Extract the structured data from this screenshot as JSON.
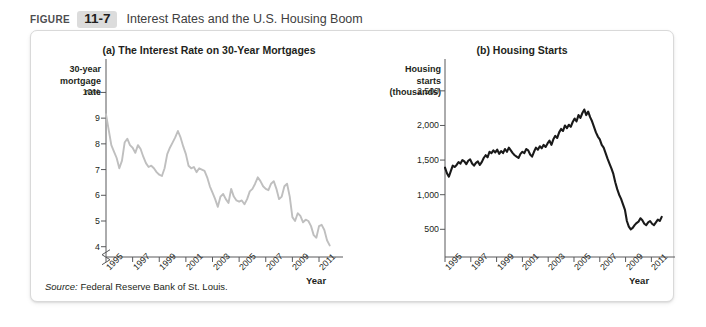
{
  "header": {
    "figure_word": "FIGURE",
    "figure_number": "11-7",
    "title": "Interest Rates and the U.S. Housing Boom"
  },
  "source": {
    "prefix": "Source:",
    "text": " Federal Reserve Bank of St. Louis."
  },
  "panel_a": {
    "title": "(a) The Interest Rate on 30-Year Mortgages",
    "ylabel": "30-year\nmortgage\nrate",
    "xlabel": "Year"
  },
  "panel_b": {
    "title": "(b) Housing Starts",
    "ylabel": "Housing\nstarts\n(thousands)",
    "xlabel": "Year"
  },
  "colors": {
    "series_a": "#bfbfbf",
    "series_b": "#1a1a1a",
    "axis": "#58595b",
    "badge_bg": "#dcdcdc"
  },
  "chart_data": [
    {
      "type": "line",
      "id": "panel_a",
      "title": "(a) The Interest Rate on 30-Year Mortgages",
      "xlabel": "Year",
      "ylabel": "30-year mortgage rate",
      "ytick_labels": [
        "10%",
        "9",
        "8",
        "7",
        "6",
        "5",
        "4"
      ],
      "ytick_values": [
        10,
        9,
        8,
        7,
        6,
        5,
        4
      ],
      "ylim": [
        3.6,
        10.6
      ],
      "axis_break": true,
      "xtick_labels": [
        "1995",
        "1997",
        "1999",
        "2001",
        "2003",
        "2005",
        "2007",
        "2009",
        "2011"
      ],
      "xtick_values": [
        1995,
        1997,
        1999,
        2001,
        2003,
        2005,
        2007,
        2009,
        2011
      ],
      "xlim": [
        1995,
        2011.9
      ],
      "grid": false,
      "legend": "none",
      "series": [
        {
          "name": "30-year mortgage rate",
          "color": "#bfbfbf",
          "x": [
            1995.0,
            1995.2,
            1995.4,
            1995.6,
            1995.8,
            1996.0,
            1996.2,
            1996.4,
            1996.6,
            1996.8,
            1997.0,
            1997.2,
            1997.4,
            1997.6,
            1997.8,
            1998.0,
            1998.2,
            1998.4,
            1998.6,
            1998.8,
            1999.0,
            1999.2,
            1999.4,
            1999.6,
            1999.8,
            2000.0,
            2000.2,
            2000.4,
            2000.6,
            2000.8,
            2001.0,
            2001.2,
            2001.4,
            2001.6,
            2001.8,
            2002.0,
            2002.2,
            2002.4,
            2002.6,
            2002.8,
            2003.0,
            2003.2,
            2003.4,
            2003.6,
            2003.8,
            2004.0,
            2004.2,
            2004.4,
            2004.6,
            2004.8,
            2005.0,
            2005.2,
            2005.4,
            2005.6,
            2005.8,
            2006.0,
            2006.2,
            2006.4,
            2006.6,
            2006.8,
            2007.0,
            2007.2,
            2007.4,
            2007.6,
            2007.8,
            2008.0,
            2008.2,
            2008.4,
            2008.6,
            2008.8,
            2009.0,
            2009.2,
            2009.4,
            2009.6,
            2009.8,
            2010.0,
            2010.2,
            2010.4,
            2010.6,
            2010.8,
            2011.0,
            2011.2,
            2011.4,
            2011.6,
            2011.8
          ],
          "y": [
            9.15,
            8.55,
            7.95,
            7.7,
            7.45,
            7.05,
            7.35,
            8.05,
            8.2,
            7.95,
            7.85,
            7.65,
            7.95,
            7.8,
            7.5,
            7.25,
            7.1,
            7.15,
            7.05,
            6.9,
            6.8,
            6.75,
            7.05,
            7.6,
            7.85,
            8.05,
            8.25,
            8.5,
            8.25,
            7.9,
            7.6,
            7.15,
            7.05,
            7.1,
            6.9,
            7.05,
            7.0,
            6.95,
            6.7,
            6.35,
            6.1,
            5.85,
            5.55,
            5.95,
            6.05,
            5.85,
            5.7,
            6.25,
            5.95,
            5.8,
            5.75,
            5.8,
            5.65,
            5.85,
            6.15,
            6.25,
            6.45,
            6.7,
            6.55,
            6.35,
            6.25,
            6.2,
            6.45,
            6.55,
            6.25,
            5.85,
            5.95,
            6.35,
            6.45,
            5.95,
            5.15,
            5.0,
            5.3,
            5.2,
            4.95,
            5.05,
            5.0,
            4.8,
            4.45,
            4.35,
            4.8,
            4.85,
            4.65,
            4.25,
            4.05
          ]
        }
      ]
    },
    {
      "type": "line",
      "id": "panel_b",
      "title": "(b) Housing Starts",
      "xlabel": "Year",
      "ylabel": "Housing starts (thousands)",
      "ytick_labels": [
        "2,500",
        "2,000",
        "1,500",
        "1,000",
        "500"
      ],
      "ytick_values": [
        2500,
        2000,
        1500,
        1000,
        500
      ],
      "ylim": [
        100,
        2700
      ],
      "axis_break": false,
      "xtick_labels": [
        "1995",
        "1997",
        "1999",
        "2001",
        "2003",
        "2005",
        "2007",
        "2009",
        "2011"
      ],
      "xtick_values": [
        1995,
        1997,
        1999,
        2001,
        2003,
        2005,
        2007,
        2009,
        2011
      ],
      "xlim": [
        1995,
        2011.9
      ],
      "grid": false,
      "legend": "none",
      "series": [
        {
          "name": "Housing starts",
          "color": "#1a1a1a",
          "x": [
            1995.0,
            1995.15,
            1995.3,
            1995.45,
            1995.6,
            1995.75,
            1995.9,
            1996.05,
            1996.2,
            1996.35,
            1996.5,
            1996.65,
            1996.8,
            1996.95,
            1997.1,
            1997.25,
            1997.4,
            1997.55,
            1997.7,
            1997.85,
            1998.0,
            1998.15,
            1998.3,
            1998.45,
            1998.6,
            1998.75,
            1998.9,
            1999.05,
            1999.2,
            1999.35,
            1999.5,
            1999.65,
            1999.8,
            1999.95,
            2000.1,
            2000.25,
            2000.4,
            2000.55,
            2000.7,
            2000.85,
            2001.0,
            2001.15,
            2001.3,
            2001.45,
            2001.6,
            2001.75,
            2001.9,
            2002.05,
            2002.2,
            2002.35,
            2002.5,
            2002.65,
            2002.8,
            2002.95,
            2003.1,
            2003.25,
            2003.4,
            2003.55,
            2003.7,
            2003.85,
            2004.0,
            2004.15,
            2004.3,
            2004.45,
            2004.6,
            2004.75,
            2004.9,
            2005.05,
            2005.2,
            2005.35,
            2005.5,
            2005.65,
            2005.8,
            2005.95,
            2006.1,
            2006.25,
            2006.4,
            2006.55,
            2006.7,
            2006.85,
            2007.0,
            2007.15,
            2007.3,
            2007.45,
            2007.6,
            2007.75,
            2007.9,
            2008.05,
            2008.2,
            2008.35,
            2008.5,
            2008.65,
            2008.8,
            2008.95,
            2009.1,
            2009.25,
            2009.4,
            2009.55,
            2009.7,
            2009.85,
            2010.0,
            2010.15,
            2010.3,
            2010.45,
            2010.6,
            2010.75,
            2010.9,
            2011.05,
            2011.2,
            2011.35,
            2011.5,
            2011.65,
            2011.8
          ],
          "y": [
            1390,
            1310,
            1260,
            1340,
            1420,
            1400,
            1430,
            1470,
            1450,
            1500,
            1480,
            1440,
            1490,
            1510,
            1450,
            1420,
            1460,
            1480,
            1430,
            1470,
            1530,
            1570,
            1540,
            1620,
            1600,
            1640,
            1610,
            1650,
            1590,
            1630,
            1600,
            1660,
            1620,
            1680,
            1640,
            1600,
            1570,
            1550,
            1530,
            1590,
            1620,
            1600,
            1660,
            1640,
            1580,
            1550,
            1620,
            1680,
            1650,
            1700,
            1670,
            1720,
            1690,
            1740,
            1780,
            1720,
            1800,
            1850,
            1820,
            1900,
            1950,
            1920,
            2000,
            1960,
            2010,
            1980,
            2050,
            2100,
            2060,
            2150,
            2110,
            2180,
            2230,
            2150,
            2200,
            2120,
            2060,
            1980,
            1900,
            1840,
            1800,
            1720,
            1680,
            1600,
            1520,
            1450,
            1380,
            1300,
            1180,
            1080,
            1000,
            940,
            860,
            780,
            620,
            540,
            500,
            520,
            560,
            590,
            610,
            660,
            630,
            580,
            560,
            600,
            620,
            580,
            560,
            600,
            640,
            620,
            680
          ]
        }
      ]
    }
  ]
}
